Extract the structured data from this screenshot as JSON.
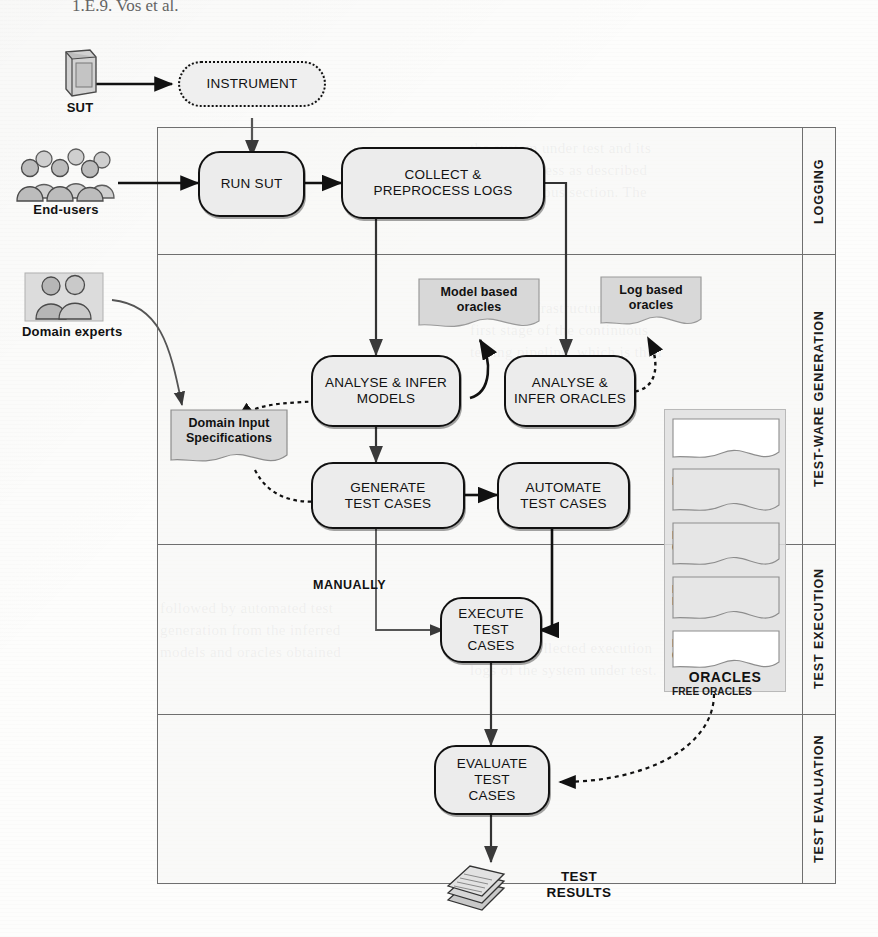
{
  "page": {
    "header_fragment": "1.E.9. Vos et al.",
    "ghost_lines": [
      "the system under test and its",
      "testing process as described",
      "in the previous section. The",
      "logging infrastructure is the",
      "first stage of the continuous",
      "testing pipeline, which is then",
      "followed by automated test",
      "generation from the inferred",
      "models and oracles obtained",
      "from the collected execution",
      "logs of the system under test."
    ]
  },
  "frame": {
    "lanes": [
      {
        "label": "LOGGING"
      },
      {
        "label": "TEST-WARE GENERATION"
      },
      {
        "label": "TEST EXECUTION"
      },
      {
        "label": "TEST EVALUATION"
      }
    ]
  },
  "actors": [
    {
      "name": "sut",
      "caption": "SUT"
    },
    {
      "name": "end-users",
      "caption": "End-users"
    },
    {
      "name": "domain-experts",
      "caption": "Domain experts"
    }
  ],
  "nodes": {
    "instrument": "INSTRUMENT",
    "run_sut": "RUN SUT",
    "collect_preprocess_logs": "COLLECT &\nPREPROCESS LOGS",
    "analyse_infer_models": "ANALYSE & INFER\nMODELS",
    "analyse_infer_oracles": "ANALYSE &\nINFER ORACLES",
    "generate_test_cases": "GENERATE\nTEST CASES",
    "automate_test_cases": "AUTOMATE\nTEST CASES",
    "execute_test_cases": "EXECUTE\nTEST CASES",
    "evaluate_test_cases": "EVALUATE TEST\nCASES"
  },
  "artifacts": {
    "model_based_oracles": "Model based\noracles",
    "log_based_oracles": "Log based\noracles",
    "domain_input_specifications": "Domain Input\nSpecifications",
    "test_results": "TEST\nRESULTS"
  },
  "oracles_panel": {
    "caption": "ORACLES",
    "items": [
      {
        "label": "HUMAN ORACLES",
        "fill": "white"
      },
      {
        "label": "PATTERN BASED\nORACLES",
        "fill": "grey"
      },
      {
        "label": "PROPERTIES\nBASED ORACLES",
        "fill": "grey"
      },
      {
        "label": "MODEL BASED\nORACLES",
        "fill": "grey"
      },
      {
        "label": "FREE ORACLES",
        "fill": "white"
      }
    ]
  },
  "edge_labels": {
    "manually": "MANUALLY"
  },
  "colors": {
    "node_fill": "#ececec",
    "node_stroke": "#111111",
    "doc_fill": "#d8d8d8",
    "frame_stroke": "#6f6f6f",
    "panel_fill": "#e0e0e0"
  }
}
